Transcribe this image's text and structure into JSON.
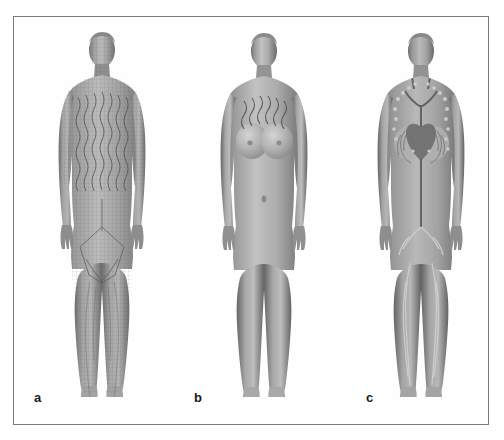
{
  "figure": {
    "kind": "multi-panel-anatomical-figure",
    "background_color": "#ffffff",
    "border_color": "#7b7b7b",
    "panel_count": 3,
    "color_mode": "grayscale"
  },
  "panels": [
    {
      "label": "a",
      "name": "wireframe-mesh-body-model",
      "description": "Full-body female figure rendered as a fine polygon wireframe mesh; dense vertical wavy contour lines run over the chest and abdomen, and mesh outlines trace the pelvis and legs.",
      "surface": "mesh",
      "skin_tone": "#9a9a9a",
      "has_internal_organs": false,
      "overlay_lines": "vertical wavy mesh contours on torso"
    },
    {
      "label": "b",
      "name": "smooth-surface-body-model",
      "description": "Full-body female figure rendered with a smooth shaded surface; a row of short wavy lines is visible across the upper chest below the collarbones.",
      "surface": "smooth",
      "skin_tone": "#a5a5a5",
      "has_internal_organs": false,
      "overlay_lines": "wavy lines across upper chest"
    },
    {
      "label": "c",
      "name": "internal-anatomy-body-model",
      "description": "Full-body female figure rendered semi-transparent to reveal internal anatomy: heart and great vessels in the chest, branching vascular and lymphatic channels in the neck, axillae, breasts, pelvis and both legs.",
      "surface": "translucent",
      "skin_tone": "#9e9e9e",
      "has_internal_organs": true,
      "visible_structures": [
        "heart",
        "great vessels",
        "cervical lymph nodes",
        "axillary lymph nodes",
        "breast lymphatic plexus",
        "thoracic duct",
        "inguinal lymph nodes",
        "lower limb lymphatic vessels"
      ]
    }
  ]
}
